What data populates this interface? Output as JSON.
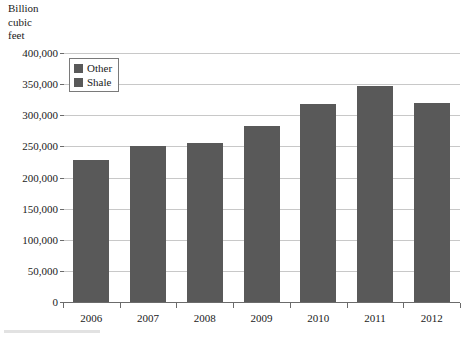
{
  "axis_title": "Billion\ncubic\nfeet",
  "legend": {
    "position": "inside-top-left",
    "entries": [
      {
        "label": "Other",
        "color": "#595959"
      },
      {
        "label": "Shale",
        "color": "#595959"
      }
    ]
  },
  "y_axis": {
    "label": "Billion cubic feet",
    "ticks": [
      "0",
      "50,000",
      "100,000",
      "150,000",
      "200,000",
      "250,000",
      "300,000",
      "350,000",
      "400,000"
    ]
  },
  "colors": {
    "bar": "#595959",
    "gridline": "#c8c8c8",
    "axis": "#6b6b6b",
    "text": "#1a1a1a",
    "background": "#ffffff"
  },
  "chart_data": {
    "type": "bar",
    "title": "",
    "subtitle": "",
    "xlabel": "",
    "ylabel": "Billion cubic feet",
    "categories": [
      "2006",
      "2007",
      "2008",
      "2009",
      "2010",
      "2011",
      "2012"
    ],
    "series": [
      {
        "name": "Shale",
        "values": [
          228000,
          250000,
          255000,
          283000,
          318000,
          347000,
          320000
        ]
      }
    ],
    "values": [
      228000,
      250000,
      255000,
      283000,
      318000,
      347000,
      320000
    ],
    "ylim": [
      0,
      400000
    ],
    "ytick_step": 50000,
    "grid": true,
    "legend_entries": [
      "Other",
      "Shale"
    ],
    "legend_position": "upper left inside plot"
  }
}
